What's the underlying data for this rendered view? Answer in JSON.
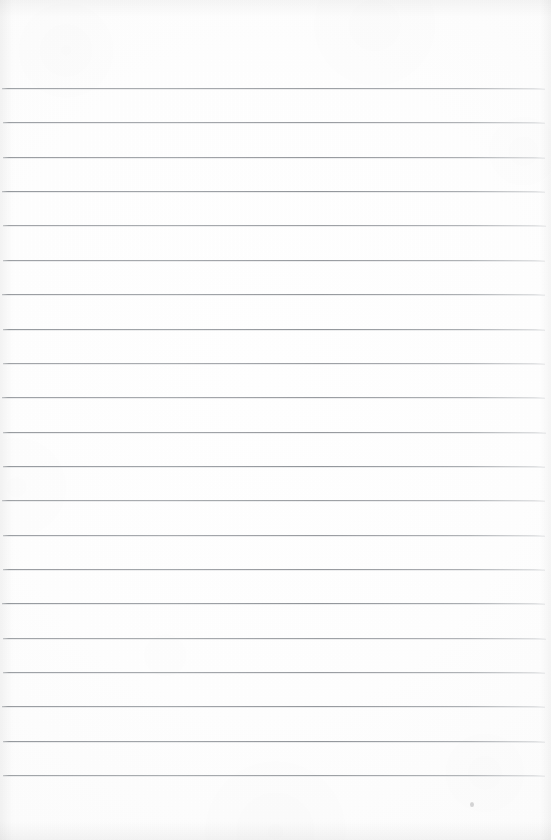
{
  "document": {
    "kind": "scanned-lined-paper",
    "title": "Blank ruled notebook page",
    "text_content": "",
    "page_width": 551,
    "page_height": 840,
    "background_color": "#fdfdfd",
    "rule_color": "#8a8e93",
    "rule_thickness_px": 1,
    "top_margin_px": 88,
    "bottom_margin_px": 65,
    "left_inset_px": 2,
    "right_inset_px": 6,
    "line_spacing_px": 34.35,
    "line_count": 21,
    "has_vertical_margin_rule": false,
    "has_holes": false,
    "has_handwriting": false,
    "rule_y_positions": [
      88,
      122.4,
      156.7,
      191.1,
      225.4,
      259.8,
      294.1,
      328.5,
      362.8,
      397.2,
      431.5,
      465.9,
      500.2,
      534.6,
      568.9,
      603.3,
      637.6,
      672.0,
      706.3,
      740.7,
      775
    ],
    "artifacts": [
      {
        "name": "scan-speck",
        "x": 470,
        "y": 802
      }
    ]
  }
}
